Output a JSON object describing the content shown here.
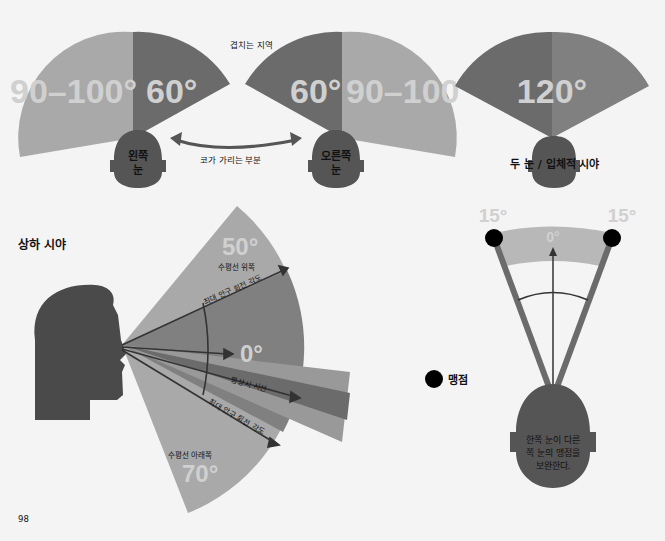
{
  "colors": {
    "background": "#f4f4f4",
    "light_sector": "#a9a9a9",
    "dark_sector": "#6b6b6b",
    "mid_sector": "#808080",
    "head": "#555555",
    "head_profile": "#4a4a4a",
    "arrow": "#333333",
    "blind_spot": "#000000",
    "big_label": "#d0d0d0"
  },
  "top": {
    "left_eye": {
      "outer_angle_label": "90–100°",
      "inner_angle_label": "60°",
      "eye_label_line1": "왼쪽",
      "eye_label_line2": "눈"
    },
    "right_eye": {
      "inner_angle_label": "60°",
      "outer_angle_label": "90–100°",
      "eye_label_line1": "오른쪽",
      "eye_label_line2": "눈"
    },
    "overlap_label": "겹치는 지역",
    "nose_block_label": "코가 가리는 부분",
    "binocular": {
      "angle_label": "120°",
      "caption": "두 눈 / 입체적 시야"
    }
  },
  "vertical": {
    "title": "상하 시야",
    "above": {
      "angle_label": "50°",
      "caption": "수평선 위쪽"
    },
    "center": {
      "angle_label": "0°"
    },
    "below": {
      "angle_label": "70°",
      "caption": "수평선 아래쪽"
    },
    "max_rotation_upper": "최대 안구 회전 각도",
    "normal_gaze": "평상시 시선",
    "max_rotation_lower": "최대 안구 회전 각도"
  },
  "blind_spot": {
    "left_angle_label": "15°",
    "right_angle_label": "15°",
    "center_label": "0°",
    "legend_label": "맹점",
    "head_text_line1": "한쪽 눈이 다른",
    "head_text_line2": "쪽 눈의 맹점을",
    "head_text_line3": "보완한다."
  },
  "page_number": "98"
}
